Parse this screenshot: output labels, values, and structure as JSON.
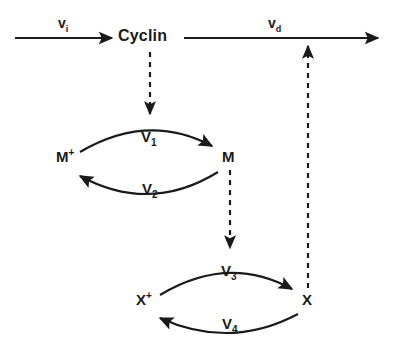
{
  "diagram": {
    "background_color": "#ffffff",
    "stroke_color": "#1a1a1a",
    "nodes": [
      {
        "id": "cyclin",
        "label": "Cyclin"
      },
      {
        "id": "m_plus",
        "base": "M",
        "superscript": "+"
      },
      {
        "id": "m",
        "base": "M",
        "superscript": ""
      },
      {
        "id": "x_plus",
        "base": "X",
        "superscript": "+"
      },
      {
        "id": "x",
        "base": "X",
        "superscript": ""
      }
    ],
    "fluxes": [
      {
        "id": "vi",
        "base": "v",
        "subscript": "i",
        "description": "cyclin synthesis"
      },
      {
        "id": "vd",
        "base": "v",
        "subscript": "d",
        "description": "cyclin degradation"
      }
    ],
    "rates": [
      {
        "id": "v1",
        "base": "V",
        "subscript": "1",
        "description": "M+ to M activation"
      },
      {
        "id": "v2",
        "base": "V",
        "subscript": "2",
        "description": "M to M+ inactivation"
      },
      {
        "id": "v3",
        "base": "V",
        "subscript": "3",
        "description": "X+ to X activation"
      },
      {
        "id": "v4",
        "base": "V",
        "subscript": "4",
        "description": "X to X+ inactivation"
      }
    ]
  }
}
